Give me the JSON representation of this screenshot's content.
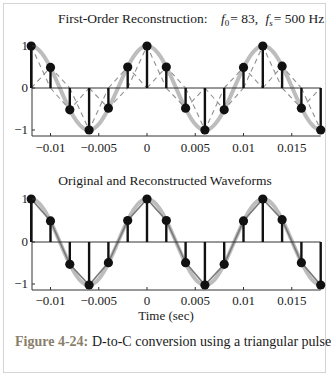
{
  "figure": {
    "caption_label": "Figure 4-24:",
    "caption_text": "D-to-C conversion using a triangular pulse"
  },
  "colors": {
    "stem": "#111111",
    "original": "#bdbdbd",
    "reconstructed_dashed": "#8f8f8f",
    "reconstructed_solid": "#7a7a7a",
    "axis": "#333333",
    "frame": "#d4d4d4",
    "caption_label": "#8a7f6d"
  },
  "chart_data": [
    {
      "type": "line",
      "title": "First-Order Reconstruction:   f0 = 83,  fs = 500 Hz",
      "title_parts": {
        "prefix": "First-Order Reconstruction:",
        "f0_label": "f",
        "f0_sub": "0",
        "f0_value": "= 83,",
        "fs_label": "f",
        "fs_sub": "s",
        "fs_value": "= 500 Hz"
      },
      "xlabel": "",
      "ylabel": "",
      "xlim": [
        -0.012,
        0.018
      ],
      "ylim": [
        -1,
        1
      ],
      "xticks": [
        -0.01,
        -0.005,
        0,
        0.005,
        0.01,
        0.015
      ],
      "xtick_labels": [
        "−0.01",
        "−0.005",
        "0",
        "0.005",
        "0.01",
        "0.015"
      ],
      "yticks": [
        -1,
        0,
        1
      ],
      "ytick_labels": [
        "−1",
        "0",
        "1"
      ],
      "grid": false,
      "series": [
        {
          "name": "samples (stem)",
          "style": "stem",
          "x": [
            -0.012,
            -0.01,
            -0.008,
            -0.006,
            -0.004,
            -0.002,
            0,
            0.002,
            0.004,
            0.006,
            0.008,
            0.01,
            0.012,
            0.014,
            0.016,
            0.018
          ],
          "values": [
            1.0,
            0.49,
            -0.52,
            -1.0,
            -0.48,
            0.5,
            1.0,
            0.5,
            -0.48,
            -1.0,
            -0.52,
            0.49,
            1.0,
            0.52,
            -0.48,
            -1.0
          ]
        },
        {
          "name": "original cosine",
          "style": "thick-light-gray",
          "frequency_hz": 83
        },
        {
          "name": "triangular pulses",
          "style": "dashed-gray",
          "pulse_halfwidth": 0.002
        }
      ]
    },
    {
      "type": "line",
      "title": "Original and Reconstructed Waveforms",
      "xlabel": "Time  (sec)",
      "ylabel": "",
      "xlim": [
        -0.012,
        0.018
      ],
      "ylim": [
        -1,
        1
      ],
      "xticks": [
        -0.01,
        -0.005,
        0,
        0.005,
        0.01,
        0.015
      ],
      "xtick_labels": [
        "−0.01",
        "−0.005",
        "0",
        "0.005",
        "0.01",
        "0.015"
      ],
      "yticks": [
        -1,
        0,
        1
      ],
      "ytick_labels": [
        "−1",
        "0",
        "1"
      ],
      "grid": false,
      "series": [
        {
          "name": "samples (stem)",
          "style": "stem",
          "x": [
            -0.012,
            -0.01,
            -0.008,
            -0.006,
            -0.004,
            -0.002,
            0,
            0.002,
            0.004,
            0.006,
            0.008,
            0.01,
            0.012,
            0.014,
            0.016,
            0.018
          ],
          "values": [
            1.0,
            0.49,
            -0.52,
            -1.0,
            -0.48,
            0.5,
            1.0,
            0.5,
            -0.48,
            -1.0,
            -0.52,
            0.49,
            1.0,
            0.52,
            -0.48,
            -1.0
          ]
        },
        {
          "name": "original cosine",
          "style": "thick-light-gray",
          "frequency_hz": 83
        },
        {
          "name": "linear interpolation (reconstructed)",
          "style": "solid-gray"
        }
      ]
    }
  ]
}
